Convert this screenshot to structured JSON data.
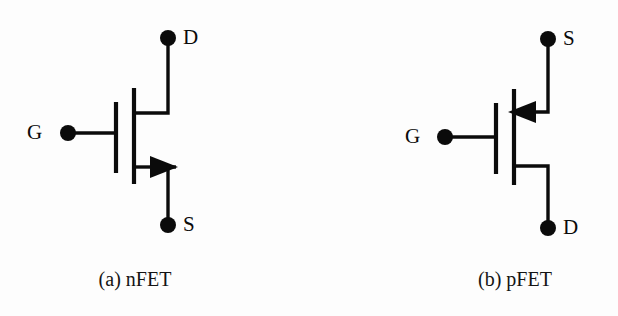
{
  "figure": {
    "background_color": "#fdfdfd",
    "ink_color": "#0b0b0b",
    "width": 618,
    "height": 316
  },
  "nfet": {
    "caption": "(a) nFET",
    "type": "nFET",
    "drain_label": "D",
    "gate_label": "G",
    "source_label": "S",
    "arrow_direction": "right",
    "arrow_meaning": "arrow points into the channel (n-channel device)",
    "drain_position": "top",
    "source_position": "bottom"
  },
  "pfet": {
    "caption": "(b) pFET",
    "type": "pFET",
    "source_label": "S",
    "gate_label": "G",
    "drain_label": "D",
    "arrow_direction": "left",
    "arrow_meaning": "arrow points out of the channel (p-channel device)",
    "source_position": "top",
    "drain_position": "bottom"
  }
}
